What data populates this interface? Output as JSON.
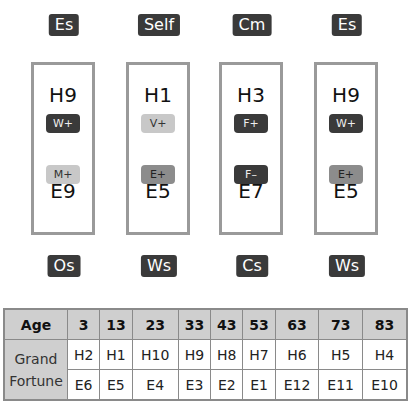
{
  "columns": [
    {
      "top_label": "Es",
      "house": "H9",
      "top_pill": {
        "text": "W+",
        "tone": "dark"
      },
      "bottom_pill": {
        "text": "M+",
        "tone": "light"
      },
      "earth": "E9",
      "bottom_label": "Os"
    },
    {
      "top_label": "Self",
      "house": "H1",
      "top_pill": {
        "text": "V+",
        "tone": "light"
      },
      "bottom_pill": {
        "text": "E+",
        "tone": "mid"
      },
      "earth": "E5",
      "bottom_label": "Ws"
    },
    {
      "top_label": "Cm",
      "house": "H3",
      "top_pill": {
        "text": "F+",
        "tone": "dark"
      },
      "bottom_pill": {
        "text": "F–",
        "tone": "dark"
      },
      "earth": "E7",
      "bottom_label": "Cs"
    },
    {
      "top_label": "Es",
      "house": "H9",
      "top_pill": {
        "text": "W+",
        "tone": "dark"
      },
      "bottom_pill": {
        "text": "E+",
        "tone": "mid"
      },
      "earth": "E5",
      "bottom_label": "Ws"
    }
  ],
  "table": {
    "age_header": "Age",
    "ages": [
      "3",
      "13",
      "23",
      "33",
      "43",
      "53",
      "63",
      "73",
      "83"
    ],
    "row_label": "Grand Fortune",
    "row_label_line1": "Grand",
    "row_label_line2": "Fortune",
    "houses": [
      "H2",
      "H1",
      "H10",
      "H9",
      "H8",
      "H7",
      "H6",
      "H5",
      "H4"
    ],
    "earths": [
      "E6",
      "E5",
      "E4",
      "E3",
      "E2",
      "E1",
      "E12",
      "E11",
      "E10"
    ]
  },
  "colors": {
    "label_bg": "#3a3a3a",
    "box_border": "#9a9a9a",
    "table_header_bg": "#cfcfcf"
  }
}
